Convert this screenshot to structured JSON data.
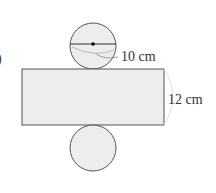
{
  "diagram": {
    "type": "cylinder-net",
    "marker": ")",
    "labels": {
      "diameter": "10 cm",
      "height": "12 cm"
    },
    "colors": {
      "fill": "#ededed",
      "stroke": "#555555",
      "text": "#333333"
    }
  }
}
